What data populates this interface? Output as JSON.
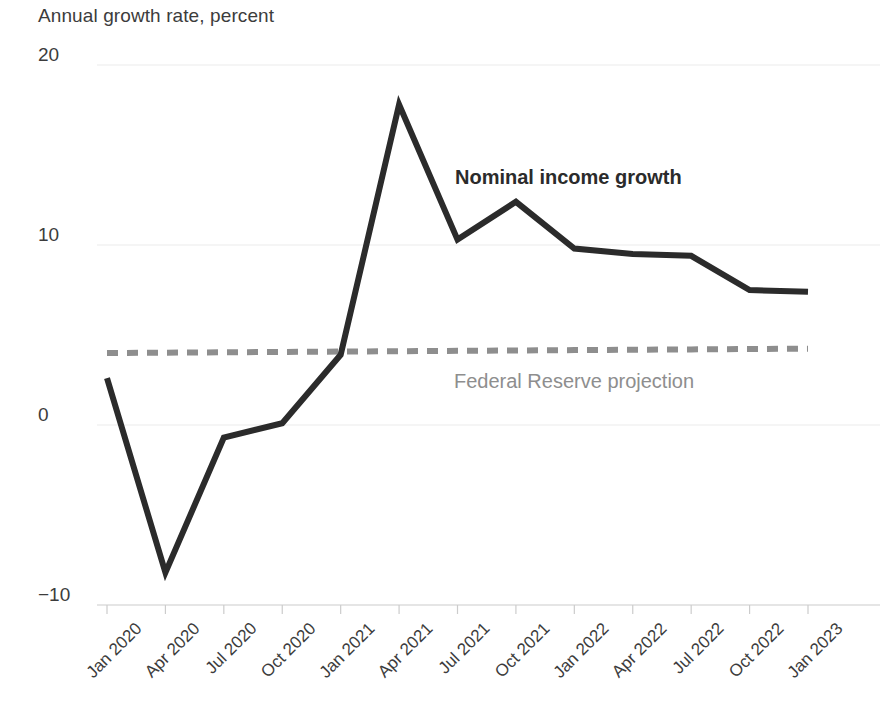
{
  "chart_data": {
    "type": "line",
    "title": "Annual growth rate, percent",
    "xlabel": "",
    "ylabel": "",
    "ylim": [
      -10,
      20
    ],
    "yticks": [
      20,
      10,
      0,
      -10
    ],
    "ytick_labels": [
      "20",
      "10",
      "0",
      "−10"
    ],
    "grid": true,
    "legend_position": "inline-annotation",
    "categories": [
      "Jan 2020",
      "Apr 2020",
      "Jul 2020",
      "Oct 2020",
      "Jan 2021",
      "Apr 2021",
      "Jul 2021",
      "Oct 2021",
      "Jan 2022",
      "Apr 2022",
      "Jul 2022",
      "Oct 2022",
      "Jan 2023"
    ],
    "series": [
      {
        "name": "Nominal income growth",
        "style": "solid",
        "color": "#2b2b2b",
        "values": [
          2.6,
          -8.2,
          -0.7,
          0.1,
          3.9,
          17.8,
          10.3,
          12.4,
          9.8,
          9.5,
          9.4,
          7.5,
          7.4
        ]
      },
      {
        "name": "Federal Reserve projection",
        "style": "dashed",
        "color": "#8e8e8e",
        "values": [
          4.0,
          4.02,
          4.04,
          4.06,
          4.08,
          4.1,
          4.12,
          4.14,
          4.16,
          4.18,
          4.2,
          4.22,
          4.24
        ]
      }
    ],
    "annotations": [
      {
        "text": "Nominal income growth",
        "x": "Jul 2021",
        "y": 14.2,
        "color": "#2b2b2b",
        "bold": true
      },
      {
        "text": "Federal Reserve projection",
        "x": "Jul 2021",
        "y": 2.8,
        "color": "#8e8e8e",
        "bold": false
      }
    ]
  },
  "labels": {
    "title": "Annual growth rate, percent",
    "nominal_series": "Nominal income growth",
    "fed_series": "Federal Reserve projection"
  },
  "colors": {
    "nominal_line": "#2b2b2b",
    "fed_line": "#8e8e8e",
    "gridline": "#ebebeb",
    "axis": "#cccccc",
    "text": "#3c3c3c"
  }
}
